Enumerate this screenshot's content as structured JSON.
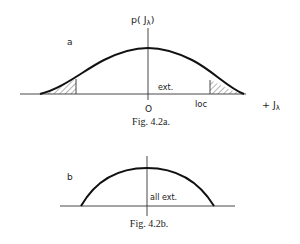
{
  "figure_a": {
    "panel_label": "a",
    "y_axis_label": "p( J",
    "y_axis_sub": "λ",
    "y_axis_close": ")",
    "origin_label": "O",
    "region_label_ext": "ext.",
    "tick_label_loc": "loc",
    "x_axis_label": "+ J",
    "x_axis_sub": "λ",
    "caption": "Fig. 4.2a."
  },
  "figure_b": {
    "panel_label": "b",
    "region_label": "all ext.",
    "caption": "Fig. 4.2b."
  },
  "colors": {
    "ink": "#222222",
    "background": "#ffffff"
  }
}
